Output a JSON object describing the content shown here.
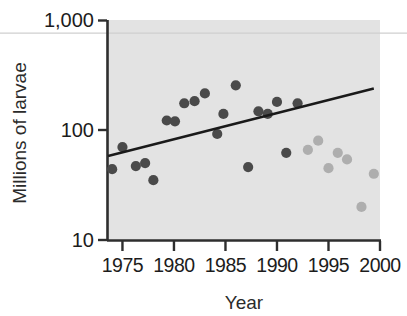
{
  "chart_data": {
    "type": "scatter",
    "title": "",
    "xlabel": "Year",
    "ylabel": "Millions of larvae",
    "xlim": [
      1973.5,
      2000
    ],
    "ylim": [
      10,
      1000
    ],
    "yscale": "log",
    "grid": false,
    "legend": null,
    "xticks": [
      1975,
      1980,
      1985,
      1990,
      1995,
      2000
    ],
    "xticklabels": [
      "1975",
      "1980",
      "1985",
      "1990",
      "1995",
      "2000"
    ],
    "yticks": [
      10,
      100,
      1000
    ],
    "yticklabels": [
      "10",
      "100",
      "1,000"
    ],
    "plot_background": "#e3e3e3",
    "series": [
      {
        "name": "dark-points",
        "color": "#4a4a4a",
        "marker": "circle",
        "points": [
          {
            "x": 1974.0,
            "y": 44
          },
          {
            "x": 1975.0,
            "y": 70
          },
          {
            "x": 1976.3,
            "y": 47
          },
          {
            "x": 1977.2,
            "y": 50
          },
          {
            "x": 1978.0,
            "y": 35
          },
          {
            "x": 1979.3,
            "y": 122
          },
          {
            "x": 1980.1,
            "y": 120
          },
          {
            "x": 1981.0,
            "y": 175
          },
          {
            "x": 1982.0,
            "y": 183
          },
          {
            "x": 1983.0,
            "y": 215
          },
          {
            "x": 1984.2,
            "y": 92
          },
          {
            "x": 1984.8,
            "y": 140
          },
          {
            "x": 1986.0,
            "y": 255
          },
          {
            "x": 1987.2,
            "y": 46
          },
          {
            "x": 1988.2,
            "y": 148
          },
          {
            "x": 1989.1,
            "y": 140
          },
          {
            "x": 1990.0,
            "y": 180
          },
          {
            "x": 1990.9,
            "y": 62
          },
          {
            "x": 1992.0,
            "y": 175
          }
        ]
      },
      {
        "name": "light-points",
        "color": "#aeaeae",
        "marker": "circle",
        "points": [
          {
            "x": 1993.0,
            "y": 66
          },
          {
            "x": 1994.0,
            "y": 80
          },
          {
            "x": 1995.0,
            "y": 45
          },
          {
            "x": 1995.9,
            "y": 62
          },
          {
            "x": 1996.8,
            "y": 54
          },
          {
            "x": 1998.2,
            "y": 20
          },
          {
            "x": 1999.4,
            "y": 40
          }
        ]
      }
    ],
    "trendline": {
      "name": "regression-line",
      "color": "#1a1a1a",
      "x_start": 1973.6,
      "y_start": 58,
      "x_end": 1999.4,
      "y_end": 238
    },
    "annotations": [
      {
        "name": "upper-reference-line",
        "type": "hline",
        "y": 760,
        "color": "#cfcfcf"
      }
    ]
  }
}
